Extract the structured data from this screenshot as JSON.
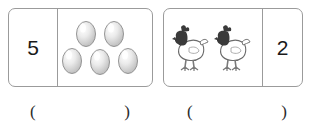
{
  "worksheet": {
    "title": "Number and picture matching exercise",
    "background_color": "#ffffff",
    "border_color": "#9b9b9b",
    "text_color": "#1a1a1a"
  },
  "problems": [
    {
      "id": "problem-1",
      "left_cell": {
        "type": "number",
        "value": "5"
      },
      "right_cell": {
        "type": "objects",
        "object_name": "egg",
        "count": 5,
        "color": "#d9d9d9",
        "outline_color": "#8a8a8a",
        "layout": "2-on-top-3-on-bottom"
      },
      "answer": {
        "open_paren": "(",
        "close_paren": ")",
        "value": ""
      }
    },
    {
      "id": "problem-2",
      "left_cell": {
        "type": "objects",
        "object_name": "chicken",
        "count": 2,
        "body_color": "#ffffff",
        "head_color": "#3a3a3a",
        "outline_color": "#6b6b6b",
        "layout": "side-by-side"
      },
      "right_cell": {
        "type": "number",
        "value": "2"
      },
      "answer": {
        "open_paren": "(",
        "close_paren": ")",
        "value": ""
      }
    }
  ],
  "icons": {
    "egg": "egg-icon",
    "chicken": "chicken-icon"
  }
}
